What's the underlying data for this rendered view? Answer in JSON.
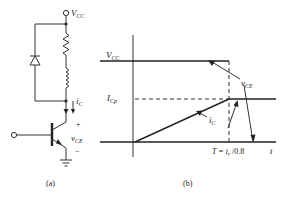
{
  "circuit": {
    "caption": "(a)",
    "supply_label_main": "V",
    "supply_label_sub": "CC",
    "current_label_main": "i",
    "current_label_sub": "C",
    "plus_sign": "+",
    "minus_sign": "−",
    "vce_label_main": "v",
    "vce_label_sub": "CE",
    "components": [
      "resistor",
      "inductor",
      "freewheeling-diode",
      "npn-transistor",
      "ground"
    ]
  },
  "waveform": {
    "caption": "(b)",
    "vcc_label_main": "V",
    "vcc_label_sub": "CC",
    "icp_label_main": "I",
    "icp_label_sub": "Cp",
    "vce_curve_label_main": "v",
    "vce_curve_label_sub": "CE",
    "ic_curve_label_main": "i",
    "ic_curve_label_sub": "C",
    "time_axis_label": "t",
    "period_label_prefix": "T = t",
    "period_label_sub": "r",
    "period_label_suffix": " /0.8"
  }
}
